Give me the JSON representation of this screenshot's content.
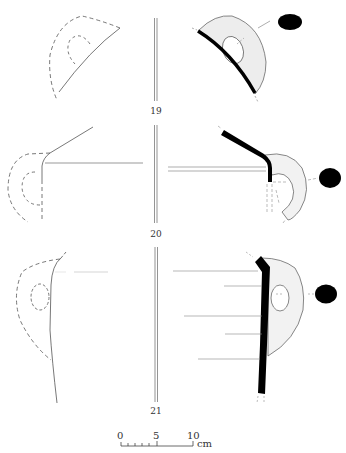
{
  "figure": {
    "type": "archaeological pottery drawing",
    "vessels": [
      {
        "number": "19",
        "label_y": 106
      },
      {
        "number": "20",
        "label_y": 229
      },
      {
        "number": "21",
        "label_y": 406
      }
    ],
    "scale_bar": {
      "ticks": [
        "0",
        "5",
        "10"
      ],
      "unit": "cm"
    },
    "colors": {
      "line": "#555555",
      "section": "#000000",
      "handle_fill": "#f2f2f2"
    }
  }
}
